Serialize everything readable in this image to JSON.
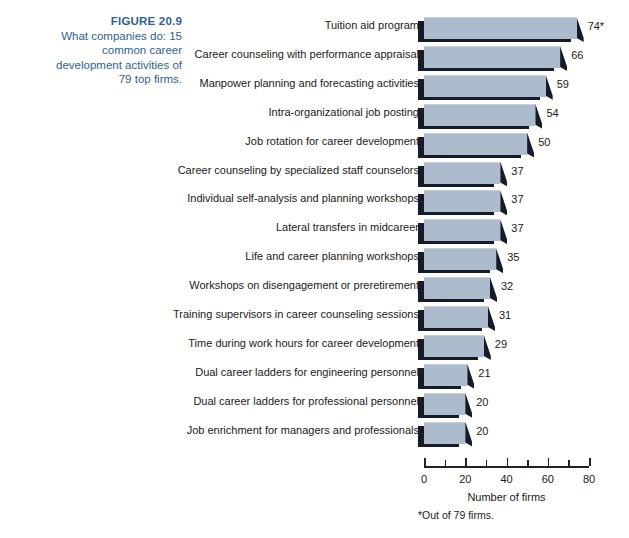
{
  "caption": {
    "figure_number": "FIGURE 20.9",
    "line1": "What companies do: 15",
    "line2": "common career",
    "line3": "development activities of",
    "line4": "79 top firms.",
    "color": "#2c5f9e"
  },
  "footnote": "*Out of 79 firms.",
  "colors": {
    "bar_face": "#adbccd",
    "bar_shadow": "#151b28",
    "background": "#fffffd",
    "text": "#1a1a1a"
  },
  "chart_data": {
    "type": "bar",
    "orientation": "horizontal",
    "title": "What companies do: 15 common career development activities of 79 top firms.",
    "xlabel": "Number of firms",
    "ylabel": "",
    "xlim": [
      0,
      80
    ],
    "xticks": [
      0,
      20,
      40,
      60,
      80
    ],
    "xtick_labels": [
      "0",
      "20",
      "40",
      "60",
      "80"
    ],
    "minor_tick_interval": 10,
    "grid": false,
    "legend": "none",
    "categories": [
      "Tuition aid program",
      "Career counseling with performance appraisal",
      "Manpower planning and forecasting activities",
      "Intra-organizational job posting",
      "Job rotation for career development",
      "Career counseling by specialized staff counselors",
      "Individual self-analysis and planning workshops",
      "Lateral transfers in midcareer",
      "Life and career planning workshops",
      "Workshops on disengagement or preretirement",
      "Training supervisors in career counseling sessions",
      "Time during work hours for career development",
      "Dual career ladders for engineering personnel",
      "Dual career ladders for professional personnel",
      "Job enrichment for managers and professionals"
    ],
    "values": [
      74,
      66,
      59,
      54,
      50,
      37,
      37,
      37,
      35,
      32,
      31,
      29,
      21,
      20,
      20
    ],
    "value_labels": [
      "74*",
      "66",
      "59",
      "54",
      "50",
      "37",
      "37",
      "37",
      "35",
      "32",
      "31",
      "29",
      "21",
      "20",
      "20"
    ]
  }
}
